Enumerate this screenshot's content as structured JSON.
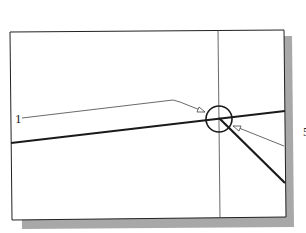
{
  "figure": {
    "type": "cad-viewport-illustration",
    "callouts": [
      {
        "id": "callout-1",
        "label": "1",
        "target": "line-intersection"
      },
      {
        "id": "callout-right",
        "label": "5",
        "target": "line-intersection",
        "note": "label partially cut off at right edge"
      }
    ],
    "elements": {
      "viewport_frame": {
        "shadow": true
      },
      "crosshair_vertical": true,
      "pickbox_circle": true,
      "lines": [
        "shallow-sloped thick line",
        "downward diagonal thick line"
      ]
    },
    "colors": {
      "line": "#1a1a1a",
      "thin_line": "#444444",
      "shadow": "#a8a8a8",
      "background": "#ffffff"
    }
  }
}
